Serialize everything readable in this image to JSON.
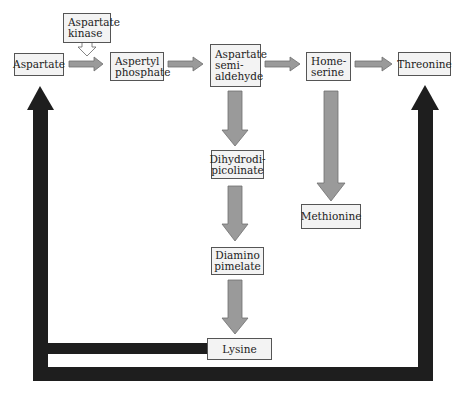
{
  "diagram": {
    "nodes": {
      "aspartate": "Aspartate",
      "aspartate_kinase": "Aspartate\nkinase",
      "aspertyl_phosphate": "Aspertyl\nphosphate",
      "aspartate_semialdehyde": "Aspartate\nsemi-\naldehyde",
      "homeserine": "Home-\nserine",
      "threonine": "Threonine",
      "dihydrodipicolinate": "Dihydrodi-\npicolinate",
      "methionine": "Methionine",
      "diaminopimelate": "Diamino\npimelate",
      "lysine": "Lysine"
    },
    "edges": [
      {
        "from": "aspartate",
        "to": "aspertyl_phosphate",
        "type": "pathway",
        "enzyme": "aspartate_kinase"
      },
      {
        "from": "aspertyl_phosphate",
        "to": "aspartate_semialdehyde",
        "type": "pathway"
      },
      {
        "from": "aspartate_semialdehyde",
        "to": "homeserine",
        "type": "pathway"
      },
      {
        "from": "homeserine",
        "to": "threonine",
        "type": "pathway"
      },
      {
        "from": "aspartate_semialdehyde",
        "to": "dihydrodipicolinate",
        "type": "pathway"
      },
      {
        "from": "homeserine",
        "to": "methionine",
        "type": "pathway"
      },
      {
        "from": "dihydrodipicolinate",
        "to": "diaminopimelate",
        "type": "pathway"
      },
      {
        "from": "diaminopimelate",
        "to": "lysine",
        "type": "pathway"
      },
      {
        "from": "lysine",
        "to": "aspartate",
        "type": "feedback"
      },
      {
        "from": "threonine",
        "to": "aspartate",
        "type": "feedback"
      }
    ],
    "colors": {
      "pathway_arrow": "#9a9a9a",
      "feedback_arrow": "#1e1e1e",
      "box_fill": "#f3f3f3",
      "box_border": "#555555"
    }
  }
}
